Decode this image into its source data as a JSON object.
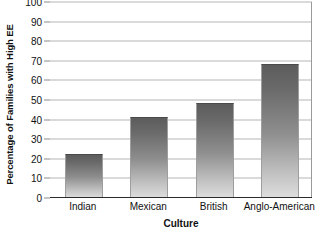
{
  "chart_data": {
    "type": "bar",
    "title": "",
    "xlabel": "Culture",
    "ylabel": "Percentage of Families with High EE",
    "categories": [
      "Indian",
      "Mexican",
      "British",
      "Anglo-American"
    ],
    "values": [
      22,
      41,
      48,
      68
    ],
    "ylim": [
      0,
      100
    ],
    "yticks": [
      0,
      10,
      20,
      30,
      40,
      50,
      60,
      70,
      80,
      90,
      100
    ],
    "ytick_labels": [
      "0",
      "10",
      "20",
      "30",
      "40",
      "50",
      "60",
      "70",
      "80",
      "90",
      "100"
    ],
    "grid": true,
    "legend": false,
    "series": [
      {
        "name": "Percentage of Families with High EE",
        "values": [
          22,
          41,
          48,
          68
        ]
      }
    ],
    "colors": {
      "bar_top": "#5c5c5c",
      "bar_bottom": "#dedede",
      "bar_edge": "#9e9e9e",
      "gridline": "#b6b6b6",
      "axis": "#2b2b2b",
      "text": "#111111",
      "background": "#ffffff"
    }
  }
}
